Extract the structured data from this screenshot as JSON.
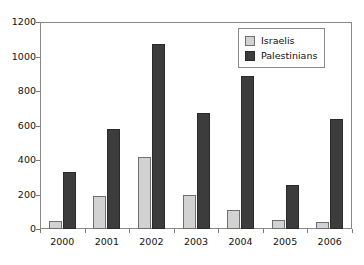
{
  "chart_data": {
    "type": "bar",
    "title": "",
    "subtitle": "",
    "xlabel": "",
    "ylabel": "",
    "categories": [
      "2000",
      "2001",
      "2002",
      "2003",
      "2004",
      "2005",
      "2006"
    ],
    "series": [
      {
        "name": "Israelis",
        "color": "#d2d2d2",
        "values": [
          45,
          190,
          420,
          195,
          110,
          50,
          40
        ]
      },
      {
        "name": "Palestinians",
        "color": "#3c3c3c",
        "values": [
          330,
          580,
          1070,
          670,
          885,
          255,
          640
        ]
      }
    ],
    "ylim": [
      0,
      1200
    ],
    "y_ticks": [
      0,
      200,
      400,
      600,
      800,
      1000,
      1200
    ],
    "y_tick_labels": [
      "0",
      "200",
      "400",
      "600",
      "800",
      "1000",
      "1200"
    ],
    "grid": false,
    "legend_position": "top-right",
    "legend_entries": [
      "Israelis",
      "Palestinians"
    ],
    "annotations": []
  }
}
